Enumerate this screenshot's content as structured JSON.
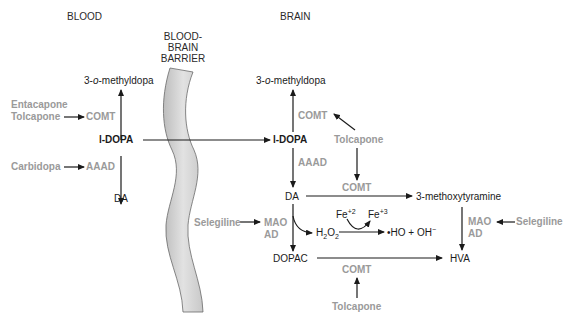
{
  "headers": {
    "blood": "BLOOD",
    "brain": "BRAIN",
    "barrier_line1": "BLOOD-",
    "barrier_line2": "BRAIN",
    "barrier_line3": "BARRIER"
  },
  "blood": {
    "methyldopa_prefix": "3-",
    "methyldopa_italic": "o",
    "methyldopa_suffix": "-methyldopa",
    "entacapone": "Entacapone",
    "tolcapone": "Tolcapone",
    "comt": "COMT",
    "ldopa": "l-DOPA",
    "carbidopa": "Carbidopa",
    "aaad": "AAAD",
    "da": "DA"
  },
  "brain": {
    "methyldopa_prefix": "3-",
    "methyldopa_italic": "o",
    "methyldopa_suffix": "-methyldopa",
    "comt_top": "COMT",
    "tolcapone_top": "Tolcapone",
    "ldopa": "l-DOPA",
    "aaad": "AAAD",
    "comt_mid": "COMT",
    "da": "DA",
    "methoxytyramine": "3-methoxytyramine",
    "selegiline_left": "Selegiline",
    "mao_left": "MAO",
    "ad_left": "AD",
    "fe2": "Fe",
    "fe2_sup": "+2",
    "fe3": "Fe",
    "fe3_sup": "+3",
    "h2o2_h": "H",
    "h2o2_sub1": "2",
    "h2o2_o": "O",
    "h2o2_sub2": "2",
    "radical": "•HO + OH",
    "radical_sup": "−",
    "mao_right": "MAO",
    "ad_right": "AD",
    "selegiline_right": "Selegiline",
    "dopac": "DOPAC",
    "hva": "HVA",
    "comt_bottom": "COMT",
    "tolcapone_bottom": "Tolcapone"
  },
  "colors": {
    "drug_enzyme_gray": "#9a9a9a",
    "text_black": "#1a1a1a",
    "barrier_fill": "#d4d4d4",
    "barrier_stroke": "#6a6a6a"
  }
}
